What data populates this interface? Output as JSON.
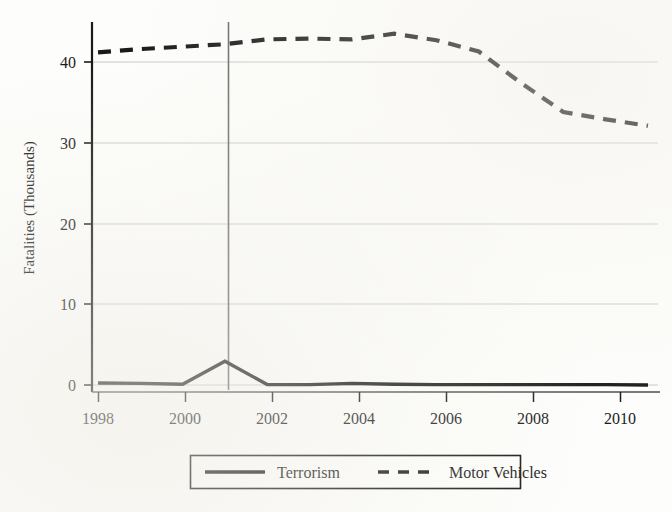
{
  "chart_data": {
    "type": "line",
    "title": "",
    "xlabel": "",
    "ylabel": "Fatalities (Thousands)",
    "xlim": [
      1998,
      2011
    ],
    "ylim": [
      0,
      45
    ],
    "yticks": [
      0,
      10,
      20,
      30,
      40
    ],
    "ytick_labels": [
      "0",
      "10",
      "20",
      "30",
      "40"
    ],
    "xticks": [
      1998,
      2000,
      2002,
      2004,
      2006,
      2008,
      2010
    ],
    "xtick_labels": [
      "1998",
      "2000",
      "2002",
      "2004",
      "2006",
      "2008",
      "2010"
    ],
    "grid": "horizontal",
    "legend_position": "below-center",
    "x": [
      1998,
      1999,
      2000,
      2001,
      2002,
      2003,
      2004,
      2005,
      2006,
      2007,
      2008,
      2009,
      2010,
      2011
    ],
    "series": [
      {
        "name": "Terrorism",
        "style": "solid",
        "color": "#1a1a1a",
        "values": [
          0.25,
          0.2,
          0.1,
          2.95,
          0.05,
          0.05,
          0.2,
          0.1,
          0.05,
          0.05,
          0.05,
          0.05,
          0.05,
          0.0
        ]
      },
      {
        "name": "Motor Vehicles",
        "style": "dashed",
        "color": "#1a1a1a",
        "values": [
          41.2,
          41.6,
          41.9,
          42.2,
          42.8,
          42.9,
          42.8,
          43.5,
          42.7,
          41.3,
          37.4,
          33.8,
          32.9,
          32.1
        ]
      }
    ],
    "annotations": [
      {
        "type": "vertical-reference-line",
        "x": 2001,
        "label": ""
      }
    ]
  },
  "legend": {
    "entries": [
      {
        "label": "Terrorism",
        "style": "solid"
      },
      {
        "label": "Motor Vehicles",
        "style": "dashed"
      }
    ]
  }
}
